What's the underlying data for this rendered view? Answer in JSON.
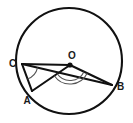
{
  "figure": {
    "type": "circle-geometry-diagram",
    "canvas": {
      "width": 133,
      "height": 123
    },
    "stroke_color": "#111111",
    "background_color": "#ffffff",
    "arc_color": "#555555"
  },
  "circle": {
    "name": "main-circle",
    "center_label": "O",
    "center_x": 69,
    "center_y": 61,
    "radius": 53,
    "stroke_width": 2.1
  },
  "points": [
    {
      "id": "O",
      "label": "O",
      "x": 70,
      "y": 65,
      "label_x": 72,
      "label_y": 59,
      "on_circle": false,
      "dot": true
    },
    {
      "id": "C",
      "label": "C",
      "x": 22,
      "y": 64,
      "label_x": 9,
      "label_y": 67,
      "on_circle": true,
      "dot": false
    },
    {
      "id": "A",
      "label": "A",
      "x": 32,
      "y": 91,
      "label_x": 27,
      "label_y": 104,
      "on_circle": true,
      "dot": false
    },
    {
      "id": "B",
      "label": "B",
      "x": 112,
      "y": 85,
      "label_x": 117,
      "label_y": 90,
      "on_circle": true,
      "dot": false
    }
  ],
  "segments": [
    {
      "id": "CA",
      "name": "chord-c-a",
      "from": "C",
      "to": "A"
    },
    {
      "id": "CB",
      "name": "chord-c-b",
      "from": "C",
      "to": "B"
    },
    {
      "id": "AO",
      "name": "radius-a-o",
      "from": "A",
      "to": "O"
    },
    {
      "id": "OB",
      "name": "radius-o-b",
      "from": "O",
      "to": "B"
    },
    {
      "id": "OC",
      "name": "radius-o-c",
      "from": "O",
      "to": "C"
    }
  ],
  "angle_marks": [
    {
      "id": "angle-ACB",
      "name": "inscribed-angle-at-c",
      "vertex": "C",
      "radius": 16,
      "label": ""
    },
    {
      "id": "angle-AOB",
      "name": "central-angle-at-o",
      "vertex": "O",
      "radius": 19,
      "label": ""
    }
  ],
  "labels": {
    "O": "O",
    "A": "A",
    "B": "B",
    "C": "C"
  }
}
